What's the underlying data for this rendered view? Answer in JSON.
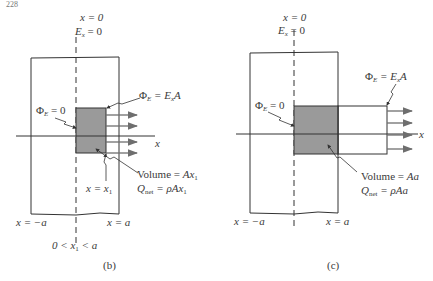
{
  "page_number": "228",
  "panels": [
    {
      "id": "b",
      "caption": "(b)",
      "top_labels": {
        "line1": "x = 0",
        "line2_var": "E",
        "line2_sub": "x",
        "line2_rest": " = 0"
      },
      "flux_right": {
        "lhs": "Φ",
        "lhs_sub": "E",
        "eq": " = E",
        "eq_sub": "x",
        "tail": "A"
      },
      "flux_left": {
        "lhs": "Φ",
        "lhs_sub": "E",
        "eq": " = 0"
      },
      "volume": {
        "label": "Volume = ",
        "value": "Ax",
        "value_sub": "1"
      },
      "qnet": {
        "label": "Q",
        "label_sub": "net",
        "eq": " = ρAx",
        "eq_sub": "1"
      },
      "x_pos": {
        "text": "x = x",
        "sub": "1"
      },
      "left_bound": "x = −a",
      "right_bound": "x = a",
      "condition": {
        "pre": "0 < x",
        "sub": "1",
        "post": " < a"
      },
      "axis_label": "x",
      "arrow_count": 4
    },
    {
      "id": "c",
      "caption": "(c)",
      "top_labels": {
        "line1": "x = 0",
        "line2_var": "E",
        "line2_sub": "x",
        "line2_rest": " = 0"
      },
      "flux_right": {
        "lhs": "Φ",
        "lhs_sub": "E",
        "eq": " = E",
        "eq_sub": "x",
        "tail": "A"
      },
      "flux_left": {
        "lhs": "Φ",
        "lhs_sub": "E",
        "eq": " = 0"
      },
      "volume": {
        "label": "Volume = ",
        "value": "Aa"
      },
      "qnet": {
        "label": "Q",
        "label_sub": "net",
        "eq": " = ρAa"
      },
      "left_bound": "x = −a",
      "right_bound": "x = a",
      "axis_label": "x",
      "arrow_count": 4
    }
  ],
  "colors": {
    "line": "#333333",
    "shaded": "#9a9a9a",
    "arrow": "#6e6e6e"
  }
}
